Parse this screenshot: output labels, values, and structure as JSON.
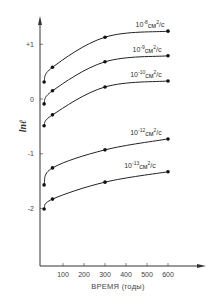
{
  "chart_data": {
    "type": "line",
    "title": "",
    "xlabel": "ВРЕМЯ (годы)",
    "ylabel": "lnℓ",
    "x_ticks": [
      100,
      200,
      300,
      400,
      500,
      600
    ],
    "y_ticks": [
      {
        "value": 1,
        "label": "+1"
      },
      {
        "value": 0,
        "label": "0"
      },
      {
        "value": -1,
        "label": "-1"
      },
      {
        "value": -2,
        "label": "-2"
      }
    ],
    "xlim": [
      0,
      700
    ],
    "ylim": [
      -3.0,
      1.5
    ],
    "grid": false,
    "legend": "inline labels above curves",
    "x": [
      10,
      50,
      300,
      600
    ],
    "series": [
      {
        "name": "10^-8 см²/с",
        "base": "10",
        "exp": "-8",
        "unit": "см",
        "unit_exp": "2",
        "unit_tail": "/с",
        "values": [
          0.31,
          0.58,
          1.13,
          1.24
        ]
      },
      {
        "name": "10^-9 см²/с",
        "base": "10",
        "exp": "-9",
        "unit": "см",
        "unit_exp": "2",
        "unit_tail": "/с",
        "values": [
          -0.09,
          0.15,
          0.68,
          0.79
        ]
      },
      {
        "name": "10^-10 см²/с",
        "base": "10",
        "exp": "-10",
        "unit": "см",
        "unit_exp": "2",
        "unit_tail": "/с",
        "values": [
          -0.49,
          -0.29,
          0.22,
          0.33
        ]
      },
      {
        "name": "10^-12 см²/с",
        "base": "10",
        "exp": "-12",
        "unit": "см",
        "unit_exp": "2",
        "unit_tail": "/с",
        "values": [
          -1.57,
          -1.26,
          -0.93,
          -0.73
        ]
      },
      {
        "name": "10^-13 см²/с",
        "base": "10",
        "exp": "-13",
        "unit": "см",
        "unit_exp": "2",
        "unit_tail": "/с",
        "values": [
          -2.01,
          -1.83,
          -1.52,
          -1.33
        ]
      }
    ]
  }
}
